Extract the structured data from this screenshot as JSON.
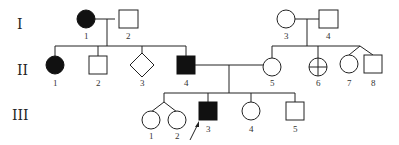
{
  "diagram": {
    "type": "pedigree",
    "generations": [
      {
        "label": "I",
        "members": [
          {
            "num": "1",
            "shape": "circle",
            "affected": true
          },
          {
            "num": "2",
            "shape": "square",
            "affected": false
          },
          {
            "num": "3",
            "shape": "circle",
            "affected": false
          },
          {
            "num": "4",
            "shape": "square",
            "affected": false
          }
        ]
      },
      {
        "label": "II",
        "members": [
          {
            "num": "1",
            "shape": "circle",
            "affected": true
          },
          {
            "num": "2",
            "shape": "square",
            "affected": false
          },
          {
            "num": "3",
            "shape": "diamond",
            "affected": false
          },
          {
            "num": "4",
            "shape": "square",
            "affected": true
          },
          {
            "num": "5",
            "shape": "circle",
            "affected": false
          },
          {
            "num": "6",
            "shape": "circle-crossed",
            "affected": false
          },
          {
            "num": "7",
            "shape": "circle",
            "affected": false,
            "twin_with": "8"
          },
          {
            "num": "8",
            "shape": "square",
            "affected": false,
            "twin_with": "7"
          }
        ]
      },
      {
        "label": "III",
        "members": [
          {
            "num": "1",
            "shape": "circle",
            "affected": false,
            "twin_with": "2"
          },
          {
            "num": "2",
            "shape": "circle",
            "affected": false,
            "twin_with": "1"
          },
          {
            "num": "3",
            "shape": "square",
            "affected": true,
            "proband": true
          },
          {
            "num": "4",
            "shape": "circle",
            "affected": false
          },
          {
            "num": "5",
            "shape": "square",
            "affected": false
          }
        ]
      }
    ]
  }
}
